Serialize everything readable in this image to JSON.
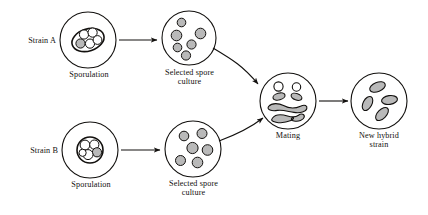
{
  "figure": {
    "background_color": "#ffffff",
    "stroke_color": "#12100e",
    "cell_fill": "#b9b9b9",
    "spore_fill": "#ffffff"
  },
  "labels": {
    "strain_a": "Strain A",
    "strain_b": "Strain B",
    "sporulation_a": "Sporulation",
    "sporulation_b": "Sporulation",
    "selected_spore_culture_a": "Selected spore\nculture",
    "selected_spore_culture_b": "Selected spore\nculture",
    "mating": "Mating",
    "new_hybrid_strain": "New hybrid\nstrain"
  },
  "nodes": [
    {
      "id": "sporulation-a",
      "label": "Sporulation",
      "cx": 88,
      "cy": 40,
      "r": 28,
      "contents": "ascus-with-spores",
      "spore_count": 5
    },
    {
      "id": "selected-spore-culture-a",
      "label": "Selected spore culture",
      "cx": 189,
      "cy": 38,
      "r": 27,
      "contents": "free-spores",
      "spore_count": 6
    },
    {
      "id": "sporulation-b",
      "label": "Sporulation",
      "cx": 90,
      "cy": 150,
      "r": 28,
      "contents": "ascus-with-spores",
      "spore_count": 5
    },
    {
      "id": "selected-spore-culture-b",
      "label": "Selected spore culture",
      "cx": 193,
      "cy": 149,
      "r": 28,
      "contents": "free-spores",
      "spore_count": 6
    },
    {
      "id": "mating",
      "label": "Mating",
      "cx": 288,
      "cy": 101,
      "r": 28,
      "contents": "mating-cells",
      "cell_count": 7
    },
    {
      "id": "new-hybrid-strain",
      "label": "New hybrid strain",
      "cx": 379,
      "cy": 101,
      "r": 28,
      "contents": "hybrid-cells",
      "cell_count": 4
    }
  ],
  "arrows": [
    {
      "id": "arrow-a-to-culture",
      "from": "sporulation-a",
      "to": "selected-spore-culture-a",
      "shape": "straight"
    },
    {
      "id": "arrow-b-to-culture",
      "from": "sporulation-b",
      "to": "selected-spore-culture-b",
      "shape": "straight"
    },
    {
      "id": "arrow-culture-a-to-mating",
      "from": "selected-spore-culture-a",
      "to": "mating",
      "shape": "curved"
    },
    {
      "id": "arrow-culture-b-to-mating",
      "from": "selected-spore-culture-b",
      "to": "mating",
      "shape": "curved"
    },
    {
      "id": "arrow-mating-to-hybrid",
      "from": "mating",
      "to": "new-hybrid-strain",
      "shape": "straight"
    }
  ]
}
